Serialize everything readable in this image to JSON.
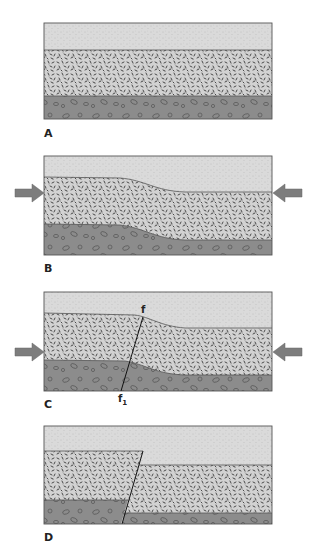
{
  "figure": {
    "colors": {
      "top_layer": "#dadada",
      "middle_layer": "#d2d2d2",
      "bottom_layer": "#8c8c8c",
      "speck": "#3a3a3a",
      "pebble_outline": "#5a5a5a",
      "arrow": "#7d7d7d",
      "border": "#555555"
    },
    "layers": [
      "fine sand (top)",
      "speckled rock (middle)",
      "conglomerate with pebbles (bottom)"
    ],
    "panels": [
      {
        "label": "A",
        "state": "horizontal layers"
      },
      {
        "label": "B",
        "state": "compression folds layers",
        "arrows": "compression from both sides"
      },
      {
        "label": "C",
        "state": "fault line develops",
        "arrows": "compression from both sides",
        "fault_top_label": "f",
        "fault_bottom_label": "f",
        "fault_bottom_subscript": "1"
      },
      {
        "label": "D",
        "state": "displaced along fault"
      }
    ]
  }
}
